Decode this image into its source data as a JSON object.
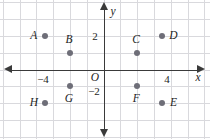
{
  "figure": {
    "type": "coordinate-plane",
    "origin_label": "O",
    "x_axis_label": "x",
    "y_axis_label": "y",
    "grid": true,
    "grid_color": "#d9d9dd",
    "axis_color": "#3a3a3a",
    "point_color": "#6e6e78",
    "background": "#ffffff"
  },
  "ticks": {
    "x": [
      {
        "label": "−4",
        "value": -4
      },
      {
        "label": "4",
        "value": 4
      }
    ],
    "y": [
      {
        "label": "2",
        "value": 2
      },
      {
        "label": "−2",
        "value": -2
      }
    ]
  },
  "chart_data": {
    "type": "scatter",
    "title": "",
    "xlabel": "x",
    "ylabel": "y",
    "xlim": [
      -6,
      6
    ],
    "ylim": [
      -4,
      4
    ],
    "grid": true,
    "legend": "none",
    "points": [
      {
        "name": "A",
        "x": -3.5,
        "y": 2,
        "label_side": "left"
      },
      {
        "name": "B",
        "x": -2,
        "y": 1,
        "label_side": "above"
      },
      {
        "name": "C",
        "x": 2,
        "y": 1,
        "label_side": "above"
      },
      {
        "name": "D",
        "x": 3.5,
        "y": 2,
        "label_side": "right"
      },
      {
        "name": "E",
        "x": 3.5,
        "y": -2,
        "label_side": "right"
      },
      {
        "name": "F",
        "x": 2,
        "y": -1,
        "label_side": "below"
      },
      {
        "name": "G",
        "x": -2,
        "y": -1,
        "label_side": "below"
      },
      {
        "name": "H",
        "x": -3.5,
        "y": -2,
        "label_side": "left"
      }
    ]
  }
}
